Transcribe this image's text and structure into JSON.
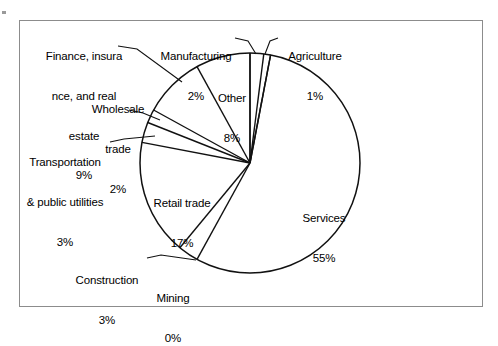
{
  "chart_data": {
    "type": "pie",
    "title": "",
    "subtitle": "",
    "xlabel": "",
    "ylabel": "",
    "legend_position": "none",
    "grid": false,
    "labels_show_percent": true,
    "start_angle_deg": 0,
    "direction": "clockwise",
    "categories": [
      "Services",
      "Retail trade",
      "Finance, insurance, and real estate",
      "Other",
      "Transportation & public utilities",
      "Manufacturing",
      "Wholesale trade",
      "Construction",
      "Agriculture",
      "Mining"
    ],
    "values": [
      55,
      17,
      9,
      8,
      3,
      2,
      2,
      3,
      1,
      0
    ],
    "units": "percent",
    "slices": [
      {
        "name": "Services",
        "value": 55,
        "percent_text": "55%"
      },
      {
        "name": "Retail trade",
        "value": 17,
        "percent_text": "17%"
      },
      {
        "name": "Finance, insurance, and real estate",
        "value": 9,
        "percent_text": "9%"
      },
      {
        "name": "Other",
        "value": 8,
        "percent_text": "8%"
      },
      {
        "name": "Transportation & public utilities",
        "value": 3,
        "percent_text": "3%"
      },
      {
        "name": "Construction",
        "value": 3,
        "percent_text": "3%"
      },
      {
        "name": "Manufacturing",
        "value": 2,
        "percent_text": "2%"
      },
      {
        "name": "Wholesale trade",
        "value": 2,
        "percent_text": "2%"
      },
      {
        "name": "Agriculture",
        "value": 1,
        "percent_text": "1%"
      },
      {
        "name": "Mining",
        "value": 0,
        "percent_text": "0%"
      }
    ]
  },
  "labels": {
    "finance": {
      "line1": "Finance, insura",
      "line2": "nce, and real",
      "line3": "estate",
      "line4": "9%"
    },
    "wholesale": {
      "line1": "Wholesale",
      "line2": "trade",
      "line3": "2%"
    },
    "transportation": {
      "line1": "Transportation",
      "line2": "& public utilities",
      "line3": "3%"
    },
    "manufacturing": {
      "line1": "Manufacturing",
      "line2": "2%"
    },
    "agriculture": {
      "line1": "Agriculture",
      "line2": "1%"
    },
    "other": {
      "line1": "Other",
      "line2": "8%"
    },
    "retail": {
      "line1": "Retail trade",
      "line2": "17%"
    },
    "services": {
      "line1": "Services",
      "line2": "55%"
    },
    "construction": {
      "line1": "Construction",
      "line2": "3%"
    },
    "mining": {
      "line1": "Mining",
      "line2": "0%"
    }
  },
  "style": {
    "frame_border_color": "#8c8c8c",
    "pie_outline_color": "#111111",
    "background_color": "#ffffff",
    "text_color": "#000000"
  }
}
